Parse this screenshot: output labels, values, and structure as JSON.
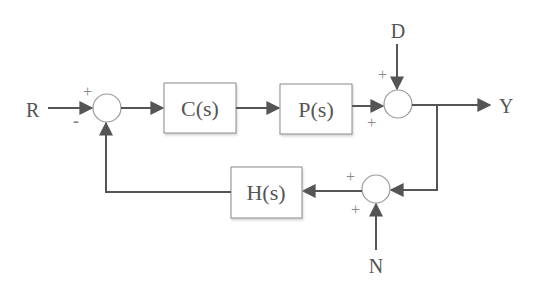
{
  "diagram": {
    "colors": {
      "line": "#555555",
      "box_border": "#8a8a8a",
      "box_fill": "#ffffff",
      "junction_border": "#9a9a9a",
      "text": "#555555",
      "sign": "#888888"
    },
    "signals": {
      "reference": "R",
      "disturbance": "D",
      "output": "Y",
      "noise": "N"
    },
    "blocks": [
      {
        "id": "controller",
        "label": "C(s)"
      },
      {
        "id": "plant",
        "label": "P(s)"
      },
      {
        "id": "sensor",
        "label": "H(s)"
      }
    ],
    "junctions": [
      {
        "id": "sum-error",
        "signs": {
          "top": "+",
          "bottom": "-"
        }
      },
      {
        "id": "sum-disturbance",
        "signs": {
          "top": "+",
          "bottom": "+"
        }
      },
      {
        "id": "sum-noise",
        "signs": {
          "top": "+",
          "bottom": "+"
        }
      }
    ]
  }
}
